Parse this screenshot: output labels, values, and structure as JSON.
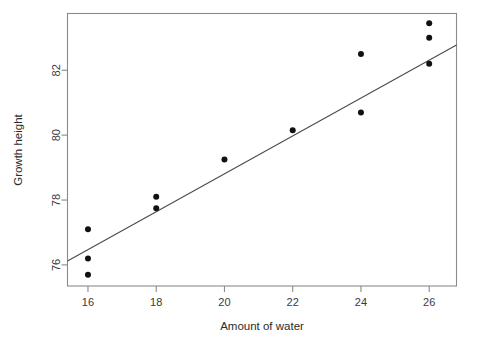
{
  "chart_data": {
    "type": "scatter",
    "title": "",
    "xlabel": "Amount of water",
    "ylabel": "Growth height",
    "xlim": [
      15.4,
      26.8
    ],
    "ylim": [
      75.35,
      83.75
    ],
    "grid": false,
    "legend": null,
    "xticks": [
      16,
      18,
      20,
      22,
      24,
      26
    ],
    "xticklabels": [
      "16",
      "18",
      "20",
      "22",
      "24",
      "26"
    ],
    "yticks": [
      76,
      78,
      80,
      82
    ],
    "yticklabels": [
      "76",
      "78",
      "80",
      "82"
    ],
    "x": [
      16,
      16,
      16,
      18,
      18,
      20,
      22,
      24,
      24,
      26,
      26,
      26
    ],
    "y": [
      77.1,
      76.2,
      75.7,
      78.1,
      77.75,
      79.25,
      80.15,
      82.5,
      80.7,
      83.45,
      83.0,
      82.2
    ],
    "points": [
      {
        "x": 16,
        "y": 77.1
      },
      {
        "x": 16,
        "y": 76.2
      },
      {
        "x": 16,
        "y": 75.7
      },
      {
        "x": 18,
        "y": 78.1
      },
      {
        "x": 18,
        "y": 77.75
      },
      {
        "x": 20,
        "y": 79.25
      },
      {
        "x": 22,
        "y": 80.15
      },
      {
        "x": 24,
        "y": 82.5
      },
      {
        "x": 24,
        "y": 80.7
      },
      {
        "x": 26,
        "y": 83.45
      },
      {
        "x": 26,
        "y": 83.0
      },
      {
        "x": 26,
        "y": 82.2
      }
    ],
    "series": [
      {
        "name": "observations",
        "type": "scatter",
        "marker": "filled-circle",
        "color": "#111111",
        "values": [
          77.1,
          76.2,
          75.7,
          78.1,
          77.75,
          79.25,
          80.15,
          82.5,
          80.7,
          83.45,
          83.0,
          82.2
        ]
      },
      {
        "name": "regression-line",
        "type": "line",
        "color": "#4a4a4a",
        "endpoints": [
          {
            "x": 15.4,
            "y": 76.12
          },
          {
            "x": 26.8,
            "y": 82.78
          }
        ]
      }
    ],
    "marker_color": "#111111",
    "line_color": "#4a4a4a",
    "axis_color": "#8a8a8a",
    "background": "#ffffff"
  }
}
